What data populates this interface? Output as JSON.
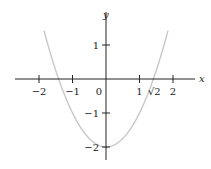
{
  "chart_data": {
    "type": "line",
    "title": "",
    "xlabel": "x",
    "ylabel": "y",
    "function": "y = x^2 - 2",
    "xlim": [
      -2.6,
      2.6
    ],
    "ylim": [
      -2.3,
      1.9
    ],
    "x_ticks": [
      -2,
      -1,
      1,
      2
    ],
    "x_tick_labels": [
      "−2",
      "−1",
      "1",
      "2"
    ],
    "origin_label": "0",
    "extra_x_label": {
      "x": 1.41421356,
      "label": "√2"
    },
    "y_ticks": [
      1,
      -1,
      -2
    ],
    "y_tick_labels": [
      "1",
      "−1",
      "−2"
    ],
    "series": [
      {
        "name": "x^2 - 2",
        "x": [
          -1.85,
          -1.5,
          -1.41421356,
          -1,
          -0.5,
          0,
          0.5,
          1,
          1.41421356,
          1.5,
          1.85
        ],
        "values": [
          1.4225,
          0.25,
          0,
          -1,
          -1.75,
          -2,
          -1.75,
          -1,
          0,
          0.25,
          1.4225
        ],
        "color": "#c8c8c8"
      }
    ],
    "grid": false,
    "legend": null
  },
  "layout": {
    "origin_px": [
      106,
      79
    ],
    "unit_px_x": 33.5,
    "unit_px_y": 34
  }
}
